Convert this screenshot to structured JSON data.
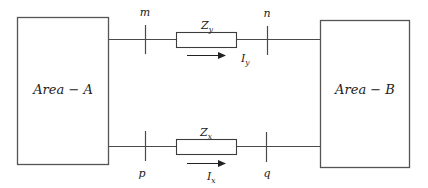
{
  "diagram": {
    "type": "two-area power system interconnection",
    "areas": [
      {
        "id": "A",
        "label": "Area − A"
      },
      {
        "id": "B",
        "label": "Area − B"
      }
    ],
    "tie_lines": [
      {
        "position": "top",
        "from_node": "m",
        "to_node": "n",
        "impedance": {
          "symbol": "Z",
          "subscript": "y"
        },
        "current": {
          "symbol": "I",
          "subscript": "y",
          "direction": "A-to-B"
        }
      },
      {
        "position": "bottom",
        "from_node": "p",
        "to_node": "q",
        "impedance": {
          "symbol": "Z",
          "subscript": "x"
        },
        "current": {
          "symbol": "I",
          "subscript": "x",
          "direction": "A-to-B"
        }
      }
    ],
    "nodes": {
      "m": "m",
      "n": "n",
      "p": "p",
      "q": "q"
    },
    "colors": {
      "stroke": "#4a4a4a",
      "text": "#222222",
      "background": "#ffffff"
    }
  }
}
